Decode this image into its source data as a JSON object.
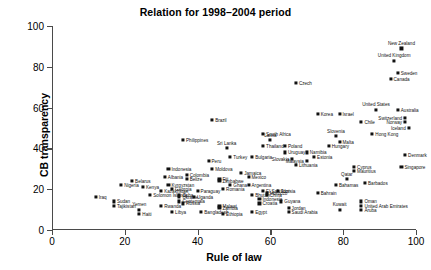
{
  "chart_data": {
    "type": "scatter",
    "title": "Relation for 1998–2004 period",
    "xlabel": "Rule of law",
    "ylabel": "CB transparency",
    "xlim": [
      0,
      100
    ],
    "ylim": [
      0,
      100
    ],
    "xticks": [
      0,
      20,
      40,
      60,
      80,
      100
    ],
    "yticks": [
      0,
      20,
      40,
      60,
      80,
      100
    ],
    "grid": false,
    "legend": "none",
    "point_marker": "filled-square",
    "points": [
      {
        "label": "New Zealand",
        "x": 96,
        "y": 89,
        "lp": "above"
      },
      {
        "label": "United Kingdom",
        "x": 94,
        "y": 83,
        "lp": "above"
      },
      {
        "label": "Sweden",
        "x": 95,
        "y": 77,
        "lp": "right"
      },
      {
        "label": "Canada",
        "x": 93,
        "y": 74,
        "lp": "right"
      },
      {
        "label": "Czech",
        "x": 67,
        "y": 72,
        "lp": "right"
      },
      {
        "label": "United States",
        "x": 89,
        "y": 59,
        "lp": "above"
      },
      {
        "label": "Australia",
        "x": 95,
        "y": 59,
        "lp": "right"
      },
      {
        "label": "Korea",
        "x": 73,
        "y": 57,
        "lp": "right"
      },
      {
        "label": "Israel",
        "x": 79,
        "y": 57,
        "lp": "right"
      },
      {
        "label": "Switzerland",
        "x": 97,
        "y": 55,
        "lp": "left"
      },
      {
        "label": "Norway",
        "x": 97,
        "y": 53,
        "lp": "left"
      },
      {
        "label": "Brazil",
        "x": 44,
        "y": 54,
        "lp": "right"
      },
      {
        "label": "Chile",
        "x": 85,
        "y": 53,
        "lp": "right"
      },
      {
        "label": "Iceland",
        "x": 98,
        "y": 50,
        "lp": "left"
      },
      {
        "label": "South Africa",
        "x": 58,
        "y": 47,
        "lp": "right"
      },
      {
        "label": "Hong Kong",
        "x": 88,
        "y": 47,
        "lp": "right"
      },
      {
        "label": "Slovenia",
        "x": 78,
        "y": 46,
        "lp": "above"
      },
      {
        "label": "Malta",
        "x": 79,
        "y": 43,
        "lp": "right"
      },
      {
        "label": "Latvia",
        "x": 60,
        "y": 44,
        "lp": "above"
      },
      {
        "label": "Philippines",
        "x": 36,
        "y": 44,
        "lp": "right"
      },
      {
        "label": "Thailand",
        "x": 58,
        "y": 41,
        "lp": "right"
      },
      {
        "label": "Poland",
        "x": 64,
        "y": 41,
        "lp": "right"
      },
      {
        "label": "Hungary",
        "x": 76,
        "y": 41,
        "lp": "right"
      },
      {
        "label": "Sri Lanka",
        "x": 48,
        "y": 40,
        "lp": "above"
      },
      {
        "label": "Uruguay",
        "x": 64,
        "y": 38,
        "lp": "right"
      },
      {
        "label": "Namibia",
        "x": 70,
        "y": 38,
        "lp": "right"
      },
      {
        "label": "Estonia",
        "x": 72,
        "y": 36,
        "lp": "right"
      },
      {
        "label": "Turkey",
        "x": 49,
        "y": 36,
        "lp": "right"
      },
      {
        "label": "Bulgaria",
        "x": 55,
        "y": 36,
        "lp": "right"
      },
      {
        "label": "Slovakia",
        "x": 66,
        "y": 35,
        "lp": "left"
      },
      {
        "label": "Malaysia",
        "x": 70,
        "y": 34,
        "lp": "left"
      },
      {
        "label": "Denmark",
        "x": 97,
        "y": 37,
        "lp": "right"
      },
      {
        "label": "Singapore",
        "x": 96,
        "y": 31,
        "lp": "right"
      },
      {
        "label": "Lithuania",
        "x": 67,
        "y": 32,
        "lp": "right"
      },
      {
        "label": "Cyprus",
        "x": 83,
        "y": 31,
        "lp": "right"
      },
      {
        "label": "Mauritius",
        "x": 83,
        "y": 29,
        "lp": "right"
      },
      {
        "label": "Indonesia",
        "x": 32,
        "y": 30,
        "lp": "right"
      },
      {
        "label": "Colombia",
        "x": 37,
        "y": 27,
        "lp": "right"
      },
      {
        "label": "Moldova",
        "x": 44,
        "y": 30,
        "lp": "right"
      },
      {
        "label": "Jamaica",
        "x": 52,
        "y": 28,
        "lp": "right"
      },
      {
        "label": "Mexico",
        "x": 54,
        "y": 26,
        "lp": "right"
      },
      {
        "label": "Peru",
        "x": 43,
        "y": 34,
        "lp": "right"
      },
      {
        "label": "Belize",
        "x": 37,
        "y": 25,
        "lp": "right"
      },
      {
        "label": "Albania",
        "x": 31,
        "y": 26,
        "lp": "right"
      },
      {
        "label": "Belarus",
        "x": 22,
        "y": 24,
        "lp": "right"
      },
      {
        "label": "Qatar",
        "x": 81,
        "y": 25,
        "lp": "above"
      },
      {
        "label": "Barbados",
        "x": 86,
        "y": 23,
        "lp": "right"
      },
      {
        "label": "Nigeria",
        "x": 19,
        "y": 22,
        "lp": "right"
      },
      {
        "label": "Kenya",
        "x": 25,
        "y": 21,
        "lp": "right"
      },
      {
        "label": "Kyrgyzstan",
        "x": 32,
        "y": 22,
        "lp": "right"
      },
      {
        "label": "Georgia",
        "x": 33,
        "y": 20,
        "lp": "right"
      },
      {
        "label": "Romania",
        "x": 47,
        "y": 20,
        "lp": "right"
      },
      {
        "label": "Ghana",
        "x": 49,
        "y": 22,
        "lp": "right"
      },
      {
        "label": "Argentina",
        "x": 54,
        "y": 22,
        "lp": "right"
      },
      {
        "label": "Fiji",
        "x": 46,
        "y": 25,
        "lp": "right"
      },
      {
        "label": "Zimbabwe",
        "x": 46,
        "y": 24,
        "lp": "right"
      },
      {
        "label": "Kazakhstan",
        "x": 30,
        "y": 19,
        "lp": "right"
      },
      {
        "label": "Solomon Islands",
        "x": 27,
        "y": 17,
        "lp": "right"
      },
      {
        "label": "Paraguay",
        "x": 40,
        "y": 19,
        "lp": "right"
      },
      {
        "label": "Cuba",
        "x": 35,
        "y": 17,
        "lp": "right"
      },
      {
        "label": "Ukraine",
        "x": 35,
        "y": 16,
        "lp": "right"
      },
      {
        "label": "Guatemala",
        "x": 35,
        "y": 14,
        "lp": "right"
      },
      {
        "label": "Russia",
        "x": 36,
        "y": 13,
        "lp": "right"
      },
      {
        "label": "Uganda",
        "x": 39,
        "y": 16,
        "lp": "right"
      },
      {
        "label": "El Salvador",
        "x": 58,
        "y": 19,
        "lp": "right"
      },
      {
        "label": "China",
        "x": 59,
        "y": 17,
        "lp": "right"
      },
      {
        "label": "Tunisia",
        "x": 62,
        "y": 19,
        "lp": "right"
      },
      {
        "label": "Morocco",
        "x": 59,
        "y": 18,
        "lp": "right"
      },
      {
        "label": "Bhutan",
        "x": 55,
        "y": 17,
        "lp": "right"
      },
      {
        "label": "Indonesia",
        "x": 57,
        "y": 15,
        "lp": "right"
      },
      {
        "label": "Croatia",
        "x": 57,
        "y": 13,
        "lp": "right"
      },
      {
        "label": "Guyana",
        "x": 63,
        "y": 14,
        "lp": "right"
      },
      {
        "label": "Bahrain",
        "x": 73,
        "y": 18,
        "lp": "right"
      },
      {
        "label": "Bahamas",
        "x": 78,
        "y": 22,
        "lp": "right"
      },
      {
        "label": "Oman",
        "x": 85,
        "y": 14,
        "lp": "right"
      },
      {
        "label": "United Arab Emirates",
        "x": 85,
        "y": 12,
        "lp": "right"
      },
      {
        "label": "Aruba",
        "x": 85,
        "y": 10,
        "lp": "right"
      },
      {
        "label": "Kuwait",
        "x": 79,
        "y": 10,
        "lp": "above"
      },
      {
        "label": "Rwanda",
        "x": 30,
        "y": 12,
        "lp": "right"
      },
      {
        "label": "Libya",
        "x": 33,
        "y": 9,
        "lp": "right"
      },
      {
        "label": "Bangladesh",
        "x": 41,
        "y": 9,
        "lp": "right"
      },
      {
        "label": "Malawi",
        "x": 46,
        "y": 12,
        "lp": "right"
      },
      {
        "label": "Zambia",
        "x": 46,
        "y": 11,
        "lp": "right"
      },
      {
        "label": "Ethiopia",
        "x": 47,
        "y": 8,
        "lp": "right"
      },
      {
        "label": "Jordan",
        "x": 65,
        "y": 11,
        "lp": "right"
      },
      {
        "label": "Saudi Arabia",
        "x": 65,
        "y": 9,
        "lp": "right"
      },
      {
        "label": "Egypt",
        "x": 55,
        "y": 9,
        "lp": "right"
      },
      {
        "label": "Iraq",
        "x": 12,
        "y": 16,
        "lp": "right"
      },
      {
        "label": "Sudan",
        "x": 17,
        "y": 14,
        "lp": "right"
      },
      {
        "label": "Tajikistan",
        "x": 17,
        "y": 12,
        "lp": "right"
      },
      {
        "label": "Yemen",
        "x": 24,
        "y": 10,
        "lp": "above"
      },
      {
        "label": "Haiti",
        "x": 24,
        "y": 8,
        "lp": "right"
      }
    ]
  }
}
